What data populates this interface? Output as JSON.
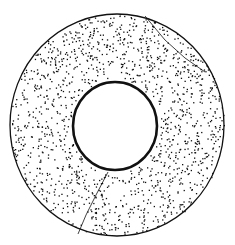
{
  "figure": {
    "description": "Stippled line drawing of a ring-shaped bead (annular disc) with a central hole",
    "colors": {
      "ink": "#111111",
      "paper": "#ffffff"
    },
    "outer": {
      "cx": 117,
      "cy": 125,
      "rx": 107,
      "ry": 111
    },
    "inner": {
      "cx": 115,
      "cy": 126,
      "rx": 42,
      "ry": 44
    },
    "crack_lines": [
      {
        "points": "108,172 96,195 86,215 78,234"
      },
      {
        "points": "145,16 165,40 185,58 205,72"
      }
    ],
    "dot_count": 1400,
    "seed": 7
  }
}
